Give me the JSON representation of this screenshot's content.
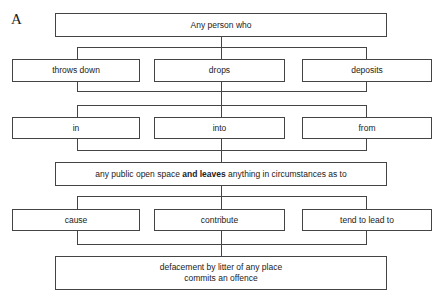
{
  "label": "A",
  "top": {
    "text": "Any person who"
  },
  "row1": [
    {
      "text": "throws down"
    },
    {
      "text": "drops"
    },
    {
      "text": "deposits"
    }
  ],
  "row2": [
    {
      "text": "in"
    },
    {
      "text": "into"
    },
    {
      "text": "from"
    }
  ],
  "middle": {
    "before": "any public open space ",
    "bold": "and leaves",
    "after": " anything in circumstances as to"
  },
  "row3": [
    {
      "text": "cause"
    },
    {
      "text": "contribute"
    },
    {
      "text": "tend to lead to"
    }
  ],
  "bottom": {
    "line1": "defacement by litter of any place",
    "line2": "commits an offence"
  }
}
